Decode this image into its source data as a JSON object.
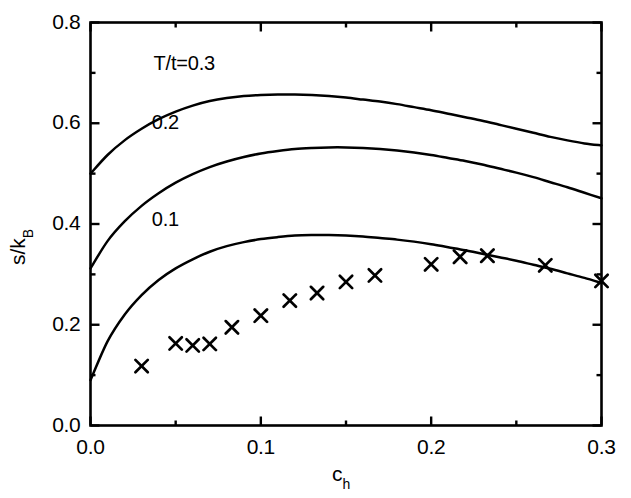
{
  "chart_data": {
    "type": "line",
    "title": "",
    "xlabel": "c_h",
    "ylabel": "s/k_B",
    "xlabel_base": "c",
    "xlabel_sub": "h",
    "ylabel_base": "s/k",
    "ylabel_sub": "B",
    "xlim": [
      0.0,
      0.3
    ],
    "ylim": [
      0.0,
      0.8
    ],
    "grid": false,
    "legend_position": "inline-curve-labels",
    "xticks": [
      0.0,
      0.1,
      0.2,
      0.3
    ],
    "xtick_labels": [
      "0.0",
      "0.1",
      "0.2",
      "0.3"
    ],
    "xminorticks": [
      0.05,
      0.15,
      0.25
    ],
    "yticks": [
      0.0,
      0.2,
      0.4,
      0.6,
      0.8
    ],
    "ytick_labels": [
      "0.0",
      "0.2",
      "0.4",
      "0.6",
      "0.8"
    ],
    "yminorticks": [
      0.1,
      0.3,
      0.5,
      0.7
    ],
    "series": [
      {
        "name": "T/t=0.3",
        "label": "T/t=0.3",
        "label_x": 0.037,
        "label_y": 0.715,
        "type": "line",
        "x": [
          0.0,
          0.01,
          0.02,
          0.03,
          0.04,
          0.05,
          0.06,
          0.07,
          0.08,
          0.09,
          0.1,
          0.11,
          0.12,
          0.13,
          0.14,
          0.15,
          0.16,
          0.17,
          0.18,
          0.19,
          0.2,
          0.21,
          0.22,
          0.23,
          0.24,
          0.25,
          0.26,
          0.27,
          0.28,
          0.29,
          0.3
        ],
        "y": [
          0.5,
          0.537,
          0.566,
          0.589,
          0.608,
          0.623,
          0.635,
          0.644,
          0.65,
          0.654,
          0.656,
          0.657,
          0.657,
          0.656,
          0.654,
          0.651,
          0.647,
          0.643,
          0.638,
          0.632,
          0.626,
          0.619,
          0.612,
          0.605,
          0.597,
          0.589,
          0.581,
          0.573,
          0.566,
          0.56,
          0.556
        ]
      },
      {
        "name": "T/t=0.2",
        "label": "0.2",
        "label_x": 0.036,
        "label_y": 0.598,
        "type": "line",
        "x": [
          0.0,
          0.01,
          0.02,
          0.03,
          0.04,
          0.05,
          0.06,
          0.07,
          0.08,
          0.09,
          0.1,
          0.11,
          0.12,
          0.13,
          0.14,
          0.15,
          0.16,
          0.17,
          0.18,
          0.19,
          0.2,
          0.21,
          0.22,
          0.23,
          0.24,
          0.25,
          0.26,
          0.27,
          0.28,
          0.29,
          0.3
        ],
        "y": [
          0.312,
          0.366,
          0.405,
          0.436,
          0.461,
          0.482,
          0.499,
          0.513,
          0.524,
          0.533,
          0.54,
          0.545,
          0.549,
          0.551,
          0.552,
          0.552,
          0.551,
          0.549,
          0.546,
          0.542,
          0.537,
          0.531,
          0.525,
          0.518,
          0.51,
          0.502,
          0.493,
          0.483,
          0.473,
          0.462,
          0.451
        ]
      },
      {
        "name": "T/t=0.1",
        "label": "0.1",
        "label_x": 0.036,
        "label_y": 0.405,
        "type": "line",
        "x": [
          0.0,
          0.01,
          0.02,
          0.03,
          0.04,
          0.05,
          0.06,
          0.07,
          0.08,
          0.09,
          0.1,
          0.11,
          0.12,
          0.13,
          0.14,
          0.15,
          0.16,
          0.17,
          0.18,
          0.19,
          0.2,
          0.21,
          0.22,
          0.23,
          0.24,
          0.25,
          0.26,
          0.27,
          0.28,
          0.29,
          0.3
        ],
        "y": [
          0.09,
          0.167,
          0.22,
          0.259,
          0.289,
          0.312,
          0.33,
          0.345,
          0.356,
          0.364,
          0.37,
          0.374,
          0.377,
          0.378,
          0.378,
          0.377,
          0.375,
          0.372,
          0.369,
          0.365,
          0.36,
          0.354,
          0.348,
          0.341,
          0.334,
          0.327,
          0.319,
          0.311,
          0.302,
          0.293,
          0.283
        ]
      },
      {
        "name": "data",
        "label": "",
        "type": "scatter",
        "marker": "x",
        "x": [
          0.03,
          0.05,
          0.06,
          0.07,
          0.083,
          0.1,
          0.117,
          0.133,
          0.15,
          0.167,
          0.2,
          0.217,
          0.233,
          0.267,
          0.3
        ],
        "y": [
          0.118,
          0.163,
          0.159,
          0.162,
          0.195,
          0.218,
          0.248,
          0.263,
          0.285,
          0.298,
          0.32,
          0.335,
          0.337,
          0.318,
          0.287
        ]
      }
    ]
  },
  "axes": {
    "frame_label": "plot-frame",
    "background": "#ffffff",
    "line_color": "#000000"
  }
}
